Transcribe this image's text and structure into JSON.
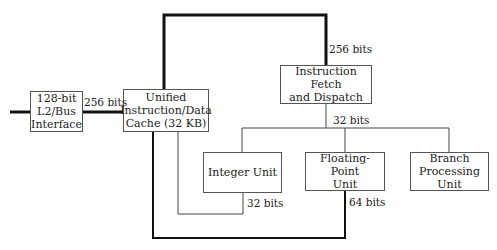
{
  "diagram": {
    "type": "block-diagram",
    "blocks": [
      {
        "id": "l2",
        "label": "128-bit\nL2/Bus\nInterface"
      },
      {
        "id": "cache",
        "label": "Unified\nInstruction/Data\nCache (32 KB)"
      },
      {
        "id": "fetch",
        "label": "Instruction Fetch\nand Dispatch"
      },
      {
        "id": "integer",
        "label": "Integer Unit"
      },
      {
        "id": "fpu",
        "label": "Floating-Point\nUnit"
      },
      {
        "id": "branch",
        "label": "Branch\nProcessing Unit"
      }
    ],
    "bus_labels": {
      "l2_cache": "256 bits",
      "cache_fetch": "256 bits",
      "fetch_units": "32 bits",
      "integer_cache": "32 bits",
      "fpu_cache": "64 bits"
    },
    "connections": [
      {
        "from": "external",
        "to": "l2",
        "width": "thick"
      },
      {
        "from": "l2",
        "to": "cache",
        "label": "256 bits",
        "width": "thick"
      },
      {
        "from": "cache",
        "to": "fetch",
        "label": "256 bits",
        "width": "thick"
      },
      {
        "from": "fetch",
        "to": [
          "integer",
          "fpu",
          "branch"
        ],
        "label": "32 bits",
        "width": "thin"
      },
      {
        "from": "integer",
        "to": "cache",
        "label": "32 bits",
        "width": "thin"
      },
      {
        "from": "fpu",
        "to": "cache",
        "label": "64 bits",
        "width": "thick"
      }
    ],
    "colors": {
      "line": "#111111",
      "box_border": "#555555",
      "background": "#ffffff"
    }
  }
}
